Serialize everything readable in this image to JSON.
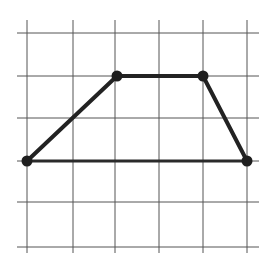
{
  "diagram": {
    "type": "trapezoid-on-grid",
    "grid": {
      "columns_x": [
        27,
        73,
        115,
        159,
        203,
        247
      ],
      "rows_y": [
        33,
        76,
        118,
        161,
        202,
        247
      ],
      "h_extent": [
        17,
        259
      ],
      "v_extent": [
        20,
        253
      ],
      "line_color": "#555555"
    },
    "vertices": [
      {
        "id": "A",
        "grid": [
          0,
          3
        ],
        "x": 27,
        "y": 161
      },
      {
        "id": "B",
        "grid": [
          2,
          1
        ],
        "x": 117,
        "y": 76
      },
      {
        "id": "C",
        "grid": [
          4,
          1
        ],
        "x": 203,
        "y": 76
      },
      {
        "id": "D",
        "grid": [
          5,
          3
        ],
        "x": 247,
        "y": 161
      }
    ],
    "edges": [
      [
        "A",
        "B"
      ],
      [
        "B",
        "C"
      ],
      [
        "C",
        "D"
      ],
      [
        "D",
        "A"
      ]
    ],
    "colors": {
      "edge": "#222222",
      "vertex": "#1e1e1e",
      "background": "#ffffff"
    }
  }
}
